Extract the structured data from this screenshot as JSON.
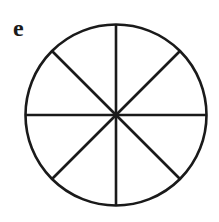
{
  "panel": {
    "label": "e",
    "figure": "circle divided into 8 equal sectors",
    "sectors": 8,
    "stroke_color": "#1a1a1a"
  }
}
